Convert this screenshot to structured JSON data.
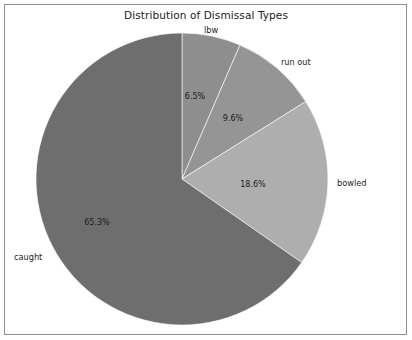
{
  "figure": {
    "title": "Distribution of Dismissal Types",
    "background_color": "#ffffff",
    "frame_color": "#8d8d8d"
  },
  "chart_data": {
    "type": "pie",
    "title": "Distribution of Dismissal Types",
    "xlabel": "",
    "ylabel": "",
    "legend_position": "none",
    "grid": false,
    "start_angle_deg": 90,
    "direction": "clockwise",
    "categories": [
      "lbw",
      "run out",
      "bowled",
      "caught"
    ],
    "values": [
      6.5,
      9.6,
      18.6,
      65.3
    ],
    "labels": [
      "lbw",
      "run out",
      "bowled",
      "caught"
    ],
    "percent_labels": [
      "6.5%",
      "9.6%",
      "18.6%",
      "65.3%"
    ],
    "colors": [
      "#8e8e8e",
      "#959595",
      "#aeaeae",
      "#6e6e6e"
    ],
    "slices": [
      {
        "name": "lbw",
        "value": 6.5,
        "percent_label": "6.5%",
        "category_label": "lbw",
        "color": "#8e8e8e",
        "pct_label_pos": {
          "x": 195,
          "y": 99
        },
        "cat_label_pos": {
          "x": 211,
          "y": 33
        },
        "cat_anchor": "middle"
      },
      {
        "name": "run out",
        "value": 9.6,
        "percent_label": "9.6%",
        "category_label": "run out",
        "color": "#959595",
        "pct_label_pos": {
          "x": 233,
          "y": 121
        },
        "cat_label_pos": {
          "x": 281,
          "y": 65
        },
        "cat_anchor": "start"
      },
      {
        "name": "bowled",
        "value": 18.6,
        "percent_label": "18.6%",
        "category_label": "bowled",
        "color": "#aeaeae",
        "pct_label_pos": {
          "x": 253,
          "y": 187
        },
        "cat_label_pos": {
          "x": 337,
          "y": 186
        },
        "cat_anchor": "start"
      },
      {
        "name": "caught",
        "value": 65.3,
        "percent_label": "65.3%",
        "category_label": "caught",
        "color": "#6e6e6e",
        "pct_label_pos": {
          "x": 97,
          "y": 225
        },
        "cat_label_pos": {
          "x": 14,
          "y": 260
        },
        "cat_anchor": "start"
      }
    ],
    "geometry": {
      "center_x": 182,
      "center_y": 179,
      "radius": 146
    }
  }
}
